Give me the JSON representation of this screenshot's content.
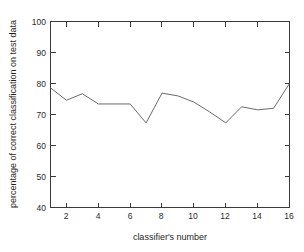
{
  "chart_data": {
    "type": "line",
    "title": "",
    "xlabel": "classifier's number",
    "ylabel": "percentage of correct classification on test data",
    "xlim": [
      1,
      16
    ],
    "ylim": [
      40,
      100
    ],
    "grid": false,
    "legend": null,
    "x": [
      1,
      2,
      3,
      4,
      5,
      6,
      7,
      8,
      9,
      10,
      11,
      12,
      13,
      14,
      15,
      16
    ],
    "values": [
      78.6,
      74.6,
      76.7,
      73.4,
      73.4,
      73.4,
      67.3,
      76.9,
      76.0,
      74.0,
      70.8,
      67.3,
      72.5,
      71.5,
      72.0,
      80.0
    ],
    "series": [
      {
        "name": "percentage of correct classification on test data",
        "color": "#6b6b6b",
        "values": [
          78.6,
          74.6,
          76.7,
          73.4,
          73.4,
          73.4,
          67.3,
          76.9,
          76.0,
          74.0,
          70.8,
          67.3,
          72.5,
          71.5,
          72.0,
          80.0
        ]
      }
    ],
    "xticks": [
      2,
      4,
      6,
      8,
      10,
      12,
      14,
      16
    ],
    "xtick_labels": [
      "2",
      "4",
      "6",
      "8",
      "10",
      "12",
      "14",
      "16"
    ],
    "xticks_minor": [
      1,
      3,
      5,
      7,
      9,
      11,
      13,
      15
    ],
    "yticks": [
      40,
      50,
      60,
      70,
      80,
      90,
      100
    ],
    "ytick_labels": [
      "40",
      "50",
      "60",
      "70",
      "80",
      "90",
      "100"
    ],
    "axis_color": "#3a3a3a",
    "line_color": "#6b6b6b",
    "background": "#ffffff"
  }
}
